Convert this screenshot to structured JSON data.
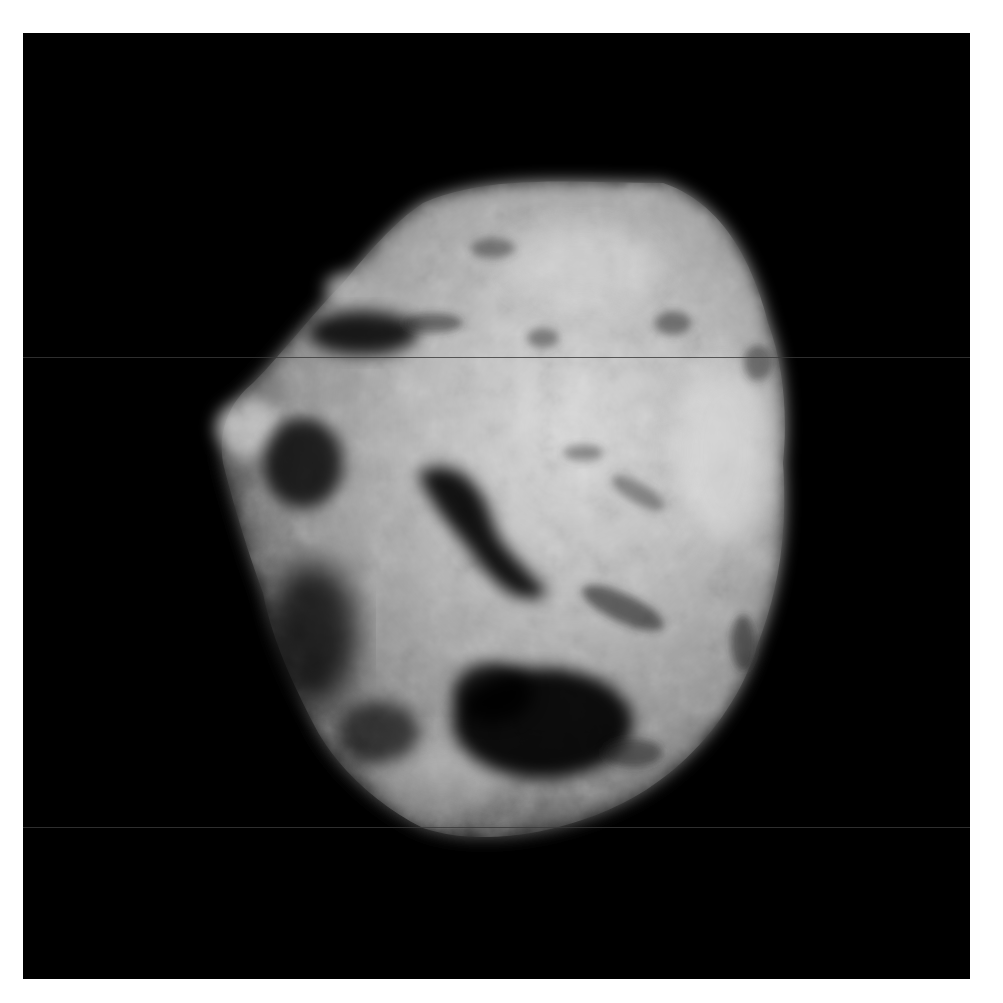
{
  "image": {
    "subject": "comet nucleus photograph (grayscale)",
    "background_color": "#000000",
    "border_color": "#ffffff",
    "surface_colors": {
      "bright": "#d8d8d8",
      "mid": "#9a9a9a",
      "shadow": "#2a2a2a"
    },
    "scanlines_y": [
      357,
      827
    ]
  }
}
